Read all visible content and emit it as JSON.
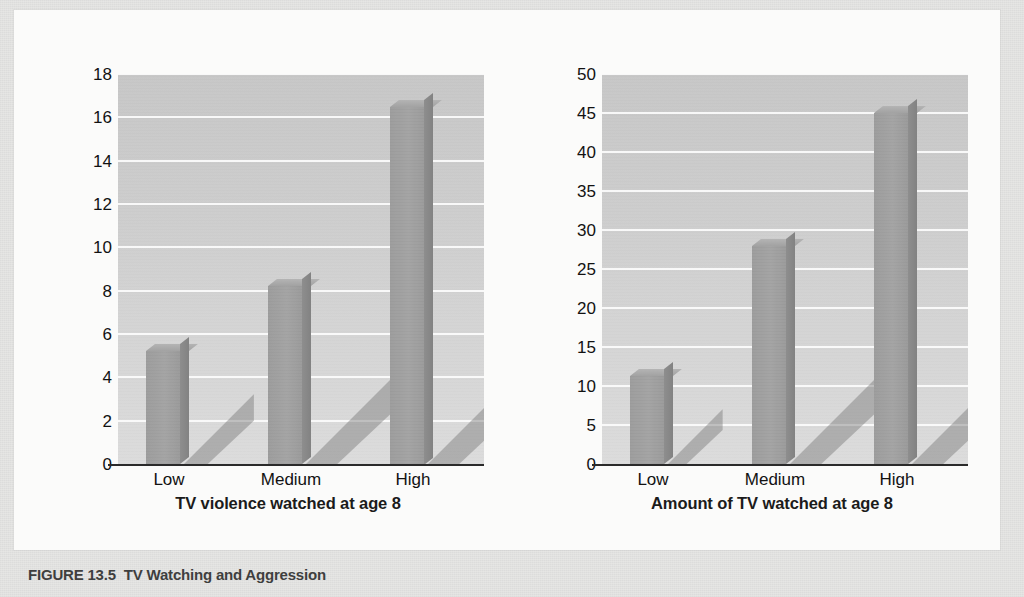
{
  "caption": {
    "figure_number": "FIGURE 13.5",
    "title": "TV Watching and Aggression"
  },
  "chart_data": [
    {
      "type": "bar",
      "id": "aggression",
      "title": "",
      "categories": [
        "Low",
        "Medium",
        "High"
      ],
      "values": [
        5.2,
        8.2,
        16.5
      ],
      "xlabel": "TV violence watched at age 8",
      "ylabel": "Aggression score at age 18",
      "ylim": [
        0,
        18
      ],
      "yticks": [
        0,
        2,
        4,
        6,
        8,
        10,
        12,
        14,
        16,
        18
      ],
      "ytick_labels": [
        "0",
        "2",
        "4",
        "6",
        "8",
        "10",
        "12",
        "14",
        "16",
        "18"
      ],
      "grid": true,
      "legend": false
    },
    {
      "type": "bar",
      "id": "crime",
      "title": "",
      "categories": [
        "Low",
        "Medium",
        "High"
      ],
      "values": [
        11.3,
        28.0,
        45.0
      ],
      "xlabel": "Amount of TV watched at age 8",
      "ylabel": "Seriousness of crime at age 30",
      "ylim": [
        0,
        50
      ],
      "yticks": [
        0,
        5,
        10,
        15,
        20,
        25,
        30,
        35,
        40,
        45,
        50
      ],
      "ytick_labels": [
        "0",
        "5",
        "10",
        "15",
        "20",
        "25",
        "30",
        "35",
        "40",
        "45",
        "50"
      ],
      "grid": true,
      "legend": false
    }
  ],
  "colors": {
    "plot_background": "#d2d2d2",
    "gridline": "#fcfcfc",
    "bar_face": "#9e9e9e",
    "bar_side": "#868686",
    "bar_top": "#aaaaaa",
    "axis_line": "#2a2a2a",
    "text": "#121212",
    "panel": "#fbfbfa",
    "page": "#e6e6e4"
  }
}
